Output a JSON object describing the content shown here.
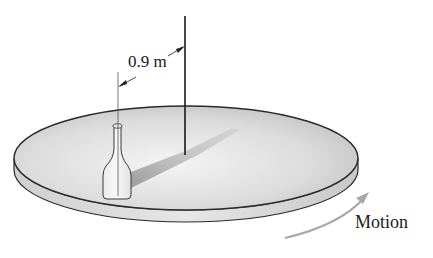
{
  "diagram": {
    "dimension": {
      "label": "0.9 m",
      "meaning": "distance from rotation axis to bottle"
    },
    "motion": {
      "label": "Motion",
      "direction": "counterclockwise (arrow curving up along front-right edge)"
    },
    "objects": [
      "disk",
      "bottle",
      "rotation-axis",
      "shadow",
      "motion-arrow"
    ],
    "colors": {
      "disk_top_light": "#f2f2f2",
      "disk_top_dark": "#b8b8b8",
      "disk_edge": "#d6d6d6",
      "outline": "#2a2a2a",
      "arrow": "#a8a8a8",
      "shadow": "#9a9a9a"
    }
  }
}
